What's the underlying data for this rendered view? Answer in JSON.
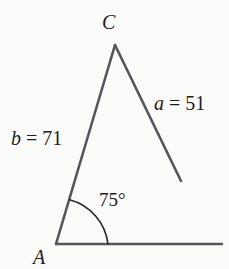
{
  "figure": {
    "type": "triangle-diagram",
    "background_color": "#fbfbfa",
    "stroke_color": "#55555a",
    "text_color": "#1c1c1c",
    "vertices": [
      {
        "name": "C",
        "label": "C",
        "x": 115,
        "y": 45
      },
      {
        "name": "A",
        "label": "A",
        "x": 56,
        "y": 244
      }
    ],
    "segments": [
      {
        "name": "side-b",
        "from": [
          56,
          244
        ],
        "to": [
          115,
          45
        ]
      },
      {
        "name": "side-a",
        "from": [
          115,
          45
        ],
        "to": [
          181,
          181
        ]
      },
      {
        "name": "base-ray",
        "from": [
          56,
          244
        ],
        "to": [
          222,
          244
        ]
      }
    ],
    "arc": {
      "name": "angle-arc",
      "center": [
        56,
        244
      ],
      "radius": 52,
      "start_angle_deg": 0,
      "end_angle_deg": 75
    },
    "labels": {
      "vertex_c": "C",
      "vertex_a": "A",
      "side_a_var": "a",
      "side_a_eq": " = 51",
      "side_a_full": "a = 51",
      "side_a_value": 51,
      "side_b_var": "b",
      "side_b_eq": " = 71",
      "side_b_full": "b = 71",
      "side_b_value": 71,
      "angle": "75°",
      "angle_value": 75
    }
  }
}
